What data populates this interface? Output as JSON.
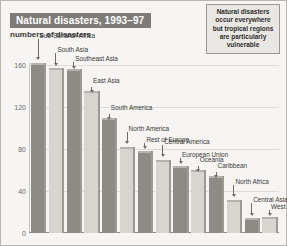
{
  "title": "Natural disasters, 1993–97",
  "subtitle": "numbers of disasters",
  "callout": "Natural disasters occur everywhere but tropical regions are particularly vulnerable",
  "caption": "",
  "colors": {
    "title_bar_bg": "#7e7c79",
    "title_text": "#ffffff",
    "bar_dark": "#8e8b86",
    "bar_light": "#d8d5d0",
    "grid": "#dedcd8",
    "page_bg": "#f6f5f3",
    "callout_bg": "#e9e7e4"
  },
  "chart_data": {
    "type": "bar",
    "title": "Natural disasters, 1993–97",
    "xlabel": "",
    "ylabel": "numbers of disasters",
    "ylim": [
      0,
      160
    ],
    "yticks": [
      0,
      40,
      80,
      120,
      160
    ],
    "grid": true,
    "legend": "none",
    "categories": [
      "Sub-Saharan Africa",
      "South Asia",
      "Southeast Asia",
      "East Asia",
      "South America",
      "North America",
      "Rest of Europe",
      "Central America",
      "European Union",
      "Oceania",
      "Caribbean",
      "North Africa",
      "Central Asia",
      "West Asia"
    ],
    "values": [
      160,
      155,
      154,
      133,
      108,
      80,
      76,
      68,
      62,
      58,
      52,
      30,
      12,
      13
    ]
  }
}
